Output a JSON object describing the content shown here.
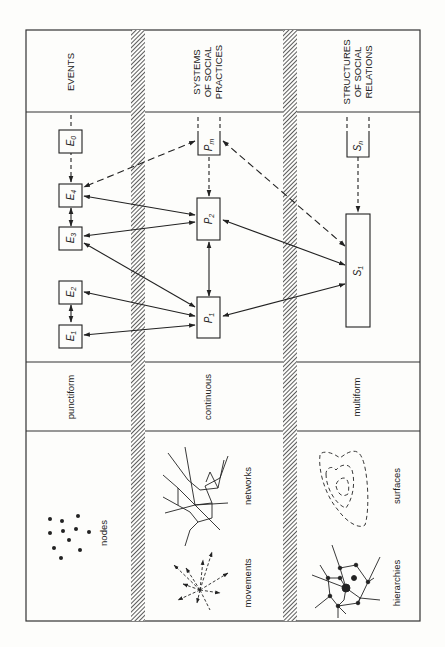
{
  "orientation": "rotated-90-ccw",
  "columns": [
    {
      "id": "events",
      "header": [
        "EVENTS"
      ],
      "form": "punctiform",
      "illustrations": [
        {
          "name": "nodes",
          "label": "nodes"
        }
      ]
    },
    {
      "id": "practices",
      "header": [
        "SYSTEMS",
        "OF SOCIAL",
        "PRACTICES"
      ],
      "form": "continuous",
      "illustrations": [
        {
          "name": "networks",
          "label": "networks"
        },
        {
          "name": "movements",
          "label": "movements"
        }
      ]
    },
    {
      "id": "structures",
      "header": [
        "STRUCTURES",
        "OF SOCIAL",
        "RELATIONS"
      ],
      "form": "multiform",
      "illustrations": [
        {
          "name": "surfaces",
          "label": "surfaces"
        },
        {
          "name": "hierarchies",
          "label": "hierarchies"
        }
      ]
    }
  ],
  "nodes": {
    "E0": {
      "base": "E",
      "sub": "0"
    },
    "E4": {
      "base": "E",
      "sub": "4"
    },
    "E3": {
      "base": "E",
      "sub": "3"
    },
    "E2": {
      "base": "E",
      "sub": "2"
    },
    "E1": {
      "base": "E",
      "sub": "1"
    },
    "Pm": {
      "base": "P",
      "sub": "m"
    },
    "P2": {
      "base": "P",
      "sub": "2"
    },
    "P1": {
      "base": "P",
      "sub": "1"
    },
    "Sn": {
      "base": "S",
      "sub": "n"
    },
    "S1": {
      "base": "S",
      "sub": "1"
    }
  },
  "edges": [
    {
      "from": "E0",
      "to": "E4",
      "style": "dashed",
      "dir": "one"
    },
    {
      "from": "E4",
      "to": "E3",
      "style": "solid",
      "dir": "both"
    },
    {
      "from": "E2",
      "to": "E1",
      "style": "solid",
      "dir": "both"
    },
    {
      "from": "Pm",
      "to": "E4",
      "style": "dashed",
      "dir": "both"
    },
    {
      "from": "Pm",
      "to": "P2",
      "style": "dashed",
      "dir": "one"
    },
    {
      "from": "Pm",
      "to": "S1",
      "style": "dashed",
      "dir": "both"
    },
    {
      "from": "E4",
      "to": "P2",
      "style": "solid",
      "dir": "both"
    },
    {
      "from": "E3",
      "to": "P2",
      "style": "solid",
      "dir": "both"
    },
    {
      "from": "E3",
      "to": "P1",
      "style": "solid",
      "dir": "both"
    },
    {
      "from": "E2",
      "to": "P1",
      "style": "solid",
      "dir": "both"
    },
    {
      "from": "E1",
      "to": "P1",
      "style": "solid",
      "dir": "both"
    },
    {
      "from": "P2",
      "to": "P1",
      "style": "solid",
      "dir": "both"
    },
    {
      "from": "P2",
      "to": "S1",
      "style": "solid",
      "dir": "both"
    },
    {
      "from": "P1",
      "to": "S1",
      "style": "solid",
      "dir": "both"
    },
    {
      "from": "Sn",
      "to": "S1",
      "style": "dashed",
      "dir": "one"
    }
  ]
}
